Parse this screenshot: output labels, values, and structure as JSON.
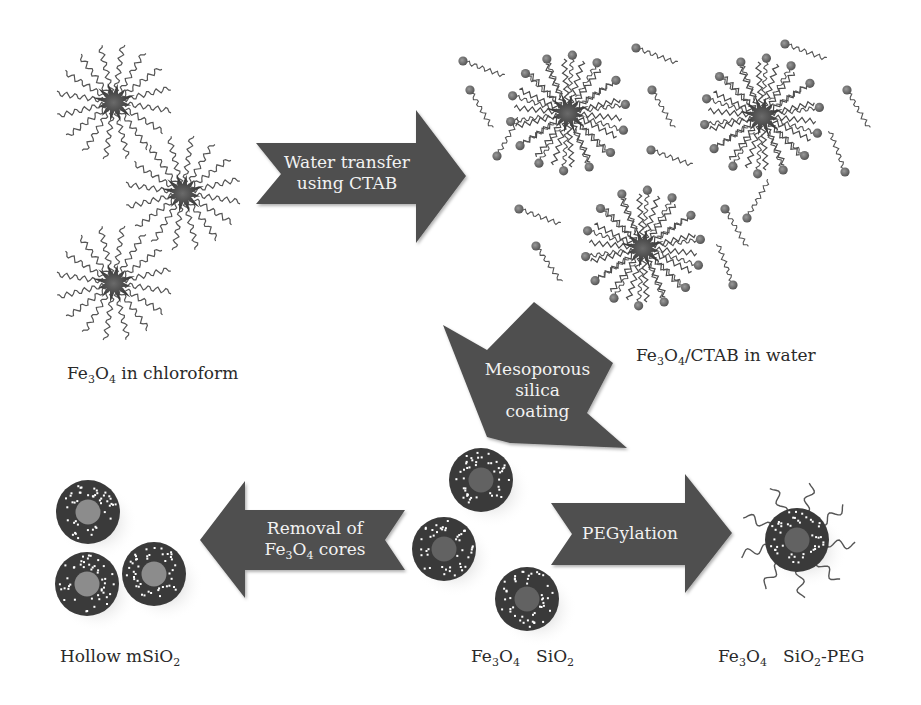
{
  "figure": {
    "type": "process-diagram",
    "colors": {
      "arrow_fill": "#4f4f4f",
      "arrow_text": "#f2f2f2",
      "ligand_stroke": "#555555",
      "core_star": "#3d3d3d",
      "shell": "#3a3a3a",
      "core_filled": "#626262",
      "core_hollow": "#8c8c8c",
      "pore_dots": "#ffffff",
      "ctab_head": "#6e6e6e",
      "label_text": "#2a2a2a"
    }
  },
  "stages": {
    "chloroform": {
      "label_parts": [
        {
          "t": "Fe"
        },
        {
          "t": "3",
          "sub": true
        },
        {
          "t": "O"
        },
        {
          "t": "4",
          "sub": true
        },
        {
          "t": " in chloroform"
        }
      ],
      "particles": [
        {
          "cx": 114,
          "cy": 102
        },
        {
          "cx": 183,
          "cy": 193
        },
        {
          "cx": 114,
          "cy": 283
        }
      ]
    },
    "ctab_water": {
      "label_parts": [
        {
          "t": "Fe"
        },
        {
          "t": "3",
          "sub": true
        },
        {
          "t": "O"
        },
        {
          "t": "4",
          "sub": true
        },
        {
          "t": "/CTAB in water"
        }
      ],
      "particles": [
        {
          "cx": 568,
          "cy": 113
        },
        {
          "cx": 762,
          "cy": 116
        },
        {
          "cx": 643,
          "cy": 248
        }
      ],
      "free_molecules": [
        {
          "x": 463,
          "y": 61,
          "angle": 20
        },
        {
          "x": 470,
          "y": 90,
          "angle": 60
        },
        {
          "x": 497,
          "y": 156,
          "angle": -60
        },
        {
          "x": 519,
          "y": 209,
          "angle": 20
        },
        {
          "x": 536,
          "y": 246,
          "angle": 55
        },
        {
          "x": 636,
          "y": 48,
          "angle": 20
        },
        {
          "x": 652,
          "y": 90,
          "angle": 60
        },
        {
          "x": 651,
          "y": 150,
          "angle": 20
        },
        {
          "x": 725,
          "y": 209,
          "angle": 60
        },
        {
          "x": 747,
          "y": 218,
          "angle": -60
        },
        {
          "x": 785,
          "y": 44,
          "angle": 20
        },
        {
          "x": 847,
          "y": 90,
          "angle": 60
        },
        {
          "x": 845,
          "y": 172,
          "angle": -110
        },
        {
          "x": 733,
          "y": 285,
          "angle": -110
        }
      ]
    },
    "core_shell": {
      "label_parts": [
        {
          "t": "Fe"
        },
        {
          "t": "3",
          "sub": true
        },
        {
          "t": "O"
        },
        {
          "t": "4",
          "sub": true
        },
        {
          "t": "   SiO"
        },
        {
          "t": "2",
          "sub": true
        }
      ],
      "particles": [
        {
          "cx": 481,
          "cy": 480
        },
        {
          "cx": 444,
          "cy": 549
        },
        {
          "cx": 527,
          "cy": 599
        }
      ]
    },
    "hollow": {
      "label_parts": [
        {
          "t": "Hollow mSiO"
        },
        {
          "t": "2",
          "sub": true
        }
      ],
      "particles": [
        {
          "cx": 88,
          "cy": 512
        },
        {
          "cx": 87,
          "cy": 584
        },
        {
          "cx": 154,
          "cy": 574
        }
      ]
    },
    "peg": {
      "label_parts": [
        {
          "t": "Fe"
        },
        {
          "t": "3",
          "sub": true
        },
        {
          "t": "O"
        },
        {
          "t": "4",
          "sub": true
        },
        {
          "t": "   SiO"
        },
        {
          "t": "2",
          "sub": true
        },
        {
          "t": "-PEG"
        }
      ],
      "particles": [
        {
          "cx": 797,
          "cy": 540
        }
      ]
    }
  },
  "arrows": [
    {
      "id": "water-transfer",
      "direction": "right",
      "lines": [
        [
          {
            "t": "Water transfer"
          }
        ],
        [
          {
            "t": "using CTAB"
          }
        ]
      ],
      "points": "256,143 416,143 416,110 466,176 416,243 416,204 256,204 281,174",
      "text_x": 272,
      "text_y": 152,
      "text_w": 150
    },
    {
      "id": "silica-coating",
      "direction": "down-left",
      "lines": [
        [
          {
            "t": "Mesoporous"
          }
        ],
        [
          {
            "t": "silica"
          }
        ],
        [
          {
            "t": "coating"
          }
        ]
      ],
      "points": "534,302 613,363 587,413 627,448 510,443 487,437 443,325 487,350",
      "text_x": 480,
      "text_y": 359,
      "text_w": 115
    },
    {
      "id": "removal-cores",
      "direction": "left",
      "lines": [
        [
          {
            "t": "Removal of"
          }
        ],
        [
          {
            "t": "Fe"
          },
          {
            "t": "3",
            "sub": true
          },
          {
            "t": "O"
          },
          {
            "t": "4",
            "sub": true
          },
          {
            "t": " cores"
          }
        ]
      ],
      "points": "405,510 385,540 405,570 245,570 245,598 200,540 245,481 245,510",
      "text_x": 250,
      "text_y": 518,
      "text_w": 130
    },
    {
      "id": "pegylation",
      "direction": "right",
      "lines": [
        [
          {
            "t": "PEGylation"
          }
        ]
      ],
      "points": "551,503 685,503 685,474 732,533 685,593 685,565 551,565 572,534",
      "text_x": 580,
      "text_y": 523,
      "text_w": 100
    }
  ],
  "labels": {
    "chloroform": {
      "x": 67,
      "y": 365
    },
    "ctab_water": {
      "x": 636,
      "y": 347
    },
    "core_shell": {
      "x": 471,
      "y": 648
    },
    "hollow": {
      "x": 60,
      "y": 648
    },
    "peg": {
      "x": 718,
      "y": 648
    }
  }
}
